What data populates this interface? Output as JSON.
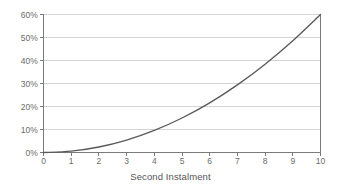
{
  "chart_data": {
    "type": "line",
    "title": "",
    "xlabel": "Second Instalment",
    "ylabel": "",
    "xlim": [
      0,
      10
    ],
    "ylim": [
      0,
      60
    ],
    "grid": true,
    "legend": false,
    "x_ticks": [
      "0",
      "1",
      "2",
      "3",
      "4",
      "5",
      "6",
      "7",
      "8",
      "9",
      "10"
    ],
    "y_ticks": [
      "0%",
      "10%",
      "20%",
      "30%",
      "40%",
      "50%",
      "60%"
    ],
    "x": [
      0,
      1,
      2,
      3,
      4,
      5,
      6,
      7,
      8,
      9,
      10
    ],
    "values": [
      0,
      0.6,
      2.4,
      5.4,
      9.6,
      15.0,
      21.6,
      29.4,
      38.4,
      48.6,
      60.0
    ],
    "series": [
      {
        "name": "Second Instalment curve",
        "values": [
          0,
          0.6,
          2.4,
          5.4,
          9.6,
          15.0,
          21.6,
          29.4,
          38.4,
          48.6,
          60.0
        ]
      }
    ],
    "line_color": "#595959",
    "grid_color": "#d4d4d4",
    "axis_color": "#7a7a7a",
    "background": "#ffffff"
  }
}
